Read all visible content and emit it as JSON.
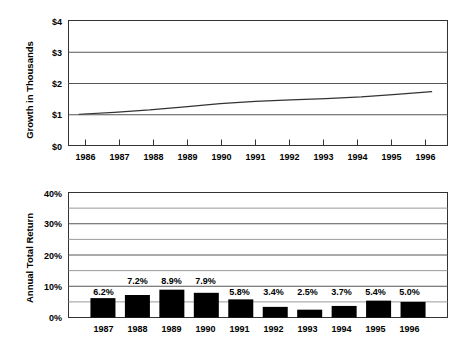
{
  "chart_data": [
    {
      "type": "line",
      "title": "",
      "xlabel": "",
      "ylabel": "Growth in Thousands",
      "x": [
        1986,
        1987,
        1988,
        1989,
        1990,
        1991,
        1992,
        1993,
        1994,
        1995,
        1996
      ],
      "xticklabels": [
        "1986",
        "1987",
        "1988",
        "1989",
        "1990",
        "1991",
        "1992",
        "1993",
        "1994",
        "1995",
        "1996"
      ],
      "values": [
        1.0,
        1.062,
        1.138,
        1.239,
        1.337,
        1.415,
        1.463,
        1.499,
        1.555,
        1.639,
        1.721
      ],
      "yticks": [
        0,
        1,
        2,
        3,
        4
      ],
      "yticklabels": [
        "$0",
        "$1",
        "$2",
        "$3",
        "$4"
      ],
      "ylim": [
        0,
        4
      ],
      "xlim": [
        1985.7,
        1996.45
      ],
      "grid": "horizontal-major",
      "legend": "none",
      "series_color": "#333333"
    },
    {
      "type": "bar",
      "title": "",
      "xlabel": "",
      "ylabel": "Annual Total Return",
      "categories": [
        "1987",
        "1988",
        "1989",
        "1990",
        "1991",
        "1992",
        "1993",
        "1994",
        "1995",
        "1996"
      ],
      "values": [
        6.2,
        7.2,
        8.9,
        7.9,
        5.8,
        3.4,
        2.5,
        3.7,
        5.4,
        5.0
      ],
      "datalabels": [
        "6.2%",
        "7.2%",
        "8.9%",
        "7.9%",
        "5.8%",
        "3.4%",
        "2.5%",
        "3.7%",
        "5.4%",
        "5.0%"
      ],
      "label_rows": [
        0,
        1,
        1,
        1,
        0,
        0,
        0,
        0,
        0,
        0
      ],
      "yticks": [
        0,
        10,
        20,
        30,
        40
      ],
      "yticklabels": [
        "0%",
        "10%",
        "20%",
        "30%",
        "40%"
      ],
      "minor_yticks": [
        5,
        15,
        25,
        35
      ],
      "ylim": [
        0,
        40
      ],
      "grid": "horizontal-major-and-minor",
      "legend": "none",
      "bar_color": "#000000"
    }
  ],
  "top_chart": {
    "ylabel": "Growth in Thousands",
    "ytick_0": "$0",
    "ytick_1": "$1",
    "ytick_2": "$2",
    "ytick_3": "$3",
    "ytick_4": "$4",
    "xtick_0": "1986",
    "xtick_1": "1987",
    "xtick_2": "1988",
    "xtick_3": "1989",
    "xtick_4": "1990",
    "xtick_5": "1991",
    "xtick_6": "1992",
    "xtick_7": "1993",
    "xtick_8": "1994",
    "xtick_9": "1995",
    "xtick_10": "1996"
  },
  "bottom_chart": {
    "ylabel": "Annual Total Return",
    "ytick_0": "0%",
    "ytick_10": "10%",
    "ytick_20": "20%",
    "ytick_30": "30%",
    "ytick_40": "40%",
    "xtick_0": "1987",
    "xtick_1": "1988",
    "xtick_2": "1989",
    "xtick_3": "1990",
    "xtick_4": "1991",
    "xtick_5": "1992",
    "xtick_6": "1993",
    "xtick_7": "1994",
    "xtick_8": "1995",
    "xtick_9": "1996",
    "label_0": "6.2%",
    "label_1": "7.2%",
    "label_2": "8.9%",
    "label_3": "7.9%",
    "label_4": "5.8%",
    "label_5": "3.4%",
    "label_6": "2.5%",
    "label_7": "3.7%",
    "label_8": "5.4%",
    "label_9": "5.0%"
  },
  "colors": {
    "bar_fill": "#000000",
    "grid_line": "#808080",
    "axis_line": "#333333",
    "line_series": "#333333",
    "background": "#ffffff"
  }
}
